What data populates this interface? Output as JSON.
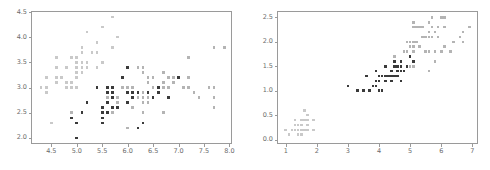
{
  "figure": {
    "background_color": "#ffffff",
    "frame_color": "#9a9a9a",
    "panel_count": 2
  },
  "series_styles": [
    {
      "name": "setosa",
      "color": "#c9c9c9",
      "marker": "square"
    },
    {
      "name": "versicolor",
      "color": "#3a3a3a",
      "marker": "square"
    },
    {
      "name": "virginica",
      "color": "#b4b4b4",
      "marker": "square"
    }
  ],
  "chart_data": [
    {
      "type": "scatter",
      "title": "",
      "xlabel": "",
      "ylabel": "",
      "xlim": [
        4.1,
        8.05
      ],
      "ylim": [
        1.88,
        4.52
      ],
      "xticks": [
        4.5,
        5.0,
        5.5,
        6.0,
        6.5,
        7.0,
        7.5,
        8.0
      ],
      "xtick_labels": [
        "4.5",
        "5.0",
        "5.5",
        "6.0",
        "6.5",
        "7.0",
        "7.5",
        "8.0"
      ],
      "yticks": [
        2.0,
        2.5,
        3.0,
        3.5,
        4.0,
        4.5
      ],
      "ytick_labels": [
        "2.0",
        "2.5",
        "3.0",
        "3.5",
        "4.0",
        "4.5"
      ],
      "grid": false,
      "legend": "none",
      "series": [
        {
          "name": "setosa",
          "color": "#c9c9c9",
          "x": [
            5.1,
            4.9,
            4.7,
            4.6,
            5.0,
            5.4,
            4.6,
            5.0,
            4.4,
            4.9,
            5.4,
            4.8,
            4.8,
            4.3,
            5.8,
            5.7,
            5.4,
            5.1,
            5.7,
            5.1,
            5.4,
            5.1,
            4.6,
            5.1,
            4.8,
            5.0,
            5.0,
            5.2,
            5.2,
            4.7,
            4.8,
            5.4,
            5.2,
            5.5,
            4.9,
            5.0,
            5.5,
            4.9,
            4.4,
            5.1,
            5.0,
            4.5,
            4.4,
            5.0,
            5.1,
            4.8,
            5.1,
            4.6,
            5.3,
            5.0
          ],
          "y": [
            3.5,
            3.0,
            3.2,
            3.1,
            3.6,
            3.9,
            3.4,
            3.4,
            2.9,
            3.1,
            3.7,
            3.4,
            3.0,
            3.0,
            4.0,
            4.4,
            3.9,
            3.5,
            3.8,
            3.8,
            3.4,
            3.7,
            3.6,
            3.3,
            3.4,
            3.0,
            3.4,
            3.5,
            3.4,
            3.2,
            3.1,
            3.4,
            4.1,
            4.2,
            3.1,
            3.2,
            3.5,
            3.6,
            3.0,
            3.4,
            3.5,
            2.3,
            3.2,
            3.5,
            3.8,
            3.0,
            3.8,
            3.2,
            3.7,
            3.3
          ]
        },
        {
          "name": "versicolor",
          "color": "#3a3a3a",
          "x": [
            7.0,
            6.4,
            6.9,
            5.5,
            6.5,
            5.7,
            6.3,
            4.9,
            6.6,
            5.2,
            5.0,
            5.9,
            6.0,
            6.1,
            5.6,
            6.7,
            5.6,
            5.8,
            6.2,
            5.6,
            5.9,
            6.1,
            6.3,
            6.1,
            6.4,
            6.6,
            6.8,
            6.7,
            6.0,
            5.7,
            5.5,
            5.5,
            5.8,
            6.0,
            5.4,
            6.0,
            6.7,
            6.3,
            5.6,
            5.5,
            5.5,
            6.1,
            5.8,
            5.0,
            5.6,
            5.7,
            5.7,
            6.2,
            5.1,
            5.7
          ],
          "y": [
            3.2,
            3.2,
            3.1,
            2.3,
            2.8,
            2.8,
            3.3,
            2.4,
            2.9,
            2.7,
            2.0,
            3.0,
            2.2,
            2.9,
            2.9,
            3.1,
            3.0,
            2.7,
            2.2,
            2.5,
            3.2,
            2.8,
            2.5,
            2.8,
            2.9,
            3.0,
            2.8,
            3.0,
            2.9,
            2.6,
            2.4,
            2.4,
            2.7,
            2.7,
            3.0,
            3.4,
            3.1,
            2.3,
            3.0,
            2.5,
            2.6,
            3.0,
            2.6,
            2.3,
            2.7,
            3.0,
            2.9,
            2.9,
            2.5,
            2.8
          ]
        },
        {
          "name": "virginica",
          "color": "#b4b4b4",
          "x": [
            6.3,
            5.8,
            7.1,
            6.3,
            6.5,
            7.6,
            4.9,
            7.3,
            6.7,
            7.2,
            6.5,
            6.4,
            6.8,
            5.7,
            5.8,
            6.4,
            6.5,
            7.7,
            7.7,
            6.0,
            6.9,
            5.6,
            7.7,
            6.3,
            6.7,
            7.2,
            6.2,
            6.1,
            6.4,
            7.2,
            7.4,
            7.9,
            6.4,
            6.3,
            6.1,
            7.7,
            6.3,
            6.4,
            6.0,
            6.9,
            6.7,
            6.9,
            5.8,
            6.8,
            6.7,
            6.7,
            6.3,
            6.5,
            6.2,
            5.9
          ],
          "y": [
            3.3,
            2.7,
            3.0,
            2.9,
            3.0,
            3.0,
            2.5,
            2.9,
            2.5,
            3.6,
            3.2,
            2.7,
            3.0,
            2.5,
            2.8,
            3.2,
            3.0,
            3.8,
            2.6,
            2.2,
            3.2,
            2.8,
            2.8,
            2.7,
            3.3,
            3.2,
            2.8,
            3.0,
            2.8,
            3.0,
            2.8,
            3.8,
            2.8,
            2.8,
            2.6,
            3.0,
            3.4,
            3.1,
            3.0,
            3.1,
            3.1,
            3.1,
            2.7,
            3.2,
            3.3,
            3.0,
            2.5,
            3.0,
            3.4,
            3.0
          ]
        }
      ]
    },
    {
      "type": "scatter",
      "title": "",
      "xlabel": "",
      "ylabel": "",
      "xlim": [
        0.72,
        7.18
      ],
      "ylim": [
        -0.09,
        2.63
      ],
      "xticks": [
        1,
        2,
        3,
        4,
        5,
        6,
        7
      ],
      "xtick_labels": [
        "1",
        "2",
        "3",
        "4",
        "5",
        "6",
        "7"
      ],
      "yticks": [
        0.0,
        0.5,
        1.0,
        1.5,
        2.0,
        2.5
      ],
      "ytick_labels": [
        "0.0",
        "0.5",
        "1.0",
        "1.5",
        "2.0",
        "2.5"
      ],
      "grid": false,
      "legend": "none",
      "series": [
        {
          "name": "setosa",
          "color": "#c9c9c9",
          "x": [
            1.4,
            1.4,
            1.3,
            1.5,
            1.4,
            1.7,
            1.4,
            1.5,
            1.4,
            1.5,
            1.5,
            1.6,
            1.4,
            1.1,
            1.2,
            1.5,
            1.3,
            1.4,
            1.7,
            1.5,
            1.7,
            1.5,
            1.0,
            1.7,
            1.9,
            1.6,
            1.6,
            1.5,
            1.4,
            1.6,
            1.6,
            1.5,
            1.5,
            1.4,
            1.5,
            1.2,
            1.3,
            1.4,
            1.3,
            1.5,
            1.3,
            1.3,
            1.3,
            1.6,
            1.9,
            1.4,
            1.6,
            1.4,
            1.5,
            1.4
          ],
          "y": [
            0.2,
            0.2,
            0.2,
            0.2,
            0.2,
            0.4,
            0.3,
            0.2,
            0.2,
            0.1,
            0.2,
            0.2,
            0.1,
            0.1,
            0.2,
            0.4,
            0.4,
            0.3,
            0.3,
            0.3,
            0.2,
            0.4,
            0.2,
            0.5,
            0.2,
            0.2,
            0.4,
            0.2,
            0.2,
            0.2,
            0.2,
            0.4,
            0.1,
            0.2,
            0.2,
            0.2,
            0.2,
            0.1,
            0.2,
            0.2,
            0.3,
            0.3,
            0.2,
            0.6,
            0.4,
            0.3,
            0.2,
            0.2,
            0.2,
            0.2
          ]
        },
        {
          "name": "versicolor",
          "color": "#3a3a3a",
          "x": [
            4.7,
            4.5,
            4.9,
            4.0,
            4.6,
            4.5,
            4.7,
            3.3,
            4.6,
            3.9,
            3.5,
            4.2,
            4.0,
            4.7,
            3.6,
            4.4,
            4.5,
            4.1,
            4.5,
            3.9,
            4.8,
            4.0,
            4.9,
            4.7,
            4.3,
            4.4,
            4.8,
            5.0,
            4.5,
            3.5,
            3.8,
            3.7,
            3.9,
            5.1,
            4.5,
            4.5,
            4.7,
            4.4,
            4.1,
            4.0,
            4.4,
            4.6,
            4.0,
            3.3,
            4.2,
            4.2,
            4.2,
            4.3,
            3.0,
            4.1
          ],
          "y": [
            1.4,
            1.5,
            1.5,
            1.3,
            1.5,
            1.3,
            1.6,
            1.0,
            1.3,
            1.4,
            1.0,
            1.5,
            1.0,
            1.4,
            1.3,
            1.4,
            1.5,
            1.0,
            1.5,
            1.1,
            1.8,
            1.3,
            1.5,
            1.2,
            1.3,
            1.4,
            1.4,
            1.7,
            1.5,
            1.0,
            1.1,
            1.0,
            1.2,
            1.6,
            1.5,
            1.6,
            1.5,
            1.3,
            1.3,
            1.3,
            1.2,
            1.4,
            1.2,
            1.0,
            1.3,
            1.2,
            1.3,
            1.3,
            1.1,
            1.3
          ]
        },
        {
          "name": "virginica",
          "color": "#b4b4b4",
          "x": [
            6.0,
            5.1,
            5.9,
            5.6,
            5.8,
            6.6,
            4.5,
            6.3,
            5.8,
            6.1,
            5.1,
            5.3,
            5.5,
            5.0,
            5.1,
            5.3,
            5.5,
            6.7,
            6.9,
            5.0,
            5.7,
            4.9,
            6.7,
            4.9,
            5.7,
            6.0,
            4.8,
            4.9,
            5.6,
            5.8,
            6.1,
            6.4,
            5.6,
            5.1,
            5.6,
            6.1,
            5.6,
            5.5,
            4.8,
            5.4,
            5.6,
            5.1,
            5.1,
            5.9,
            5.7,
            5.2,
            5.0,
            5.2,
            5.4,
            5.1
          ],
          "y": [
            2.5,
            1.9,
            2.1,
            1.8,
            2.2,
            2.1,
            1.7,
            1.8,
            1.8,
            2.5,
            2.0,
            1.9,
            2.1,
            2.0,
            2.4,
            2.3,
            1.8,
            2.2,
            2.3,
            1.5,
            2.3,
            2.0,
            2.0,
            1.8,
            2.1,
            1.8,
            1.8,
            1.8,
            2.1,
            1.6,
            1.9,
            2.0,
            2.2,
            1.5,
            1.4,
            2.3,
            2.4,
            1.8,
            1.8,
            2.1,
            2.4,
            2.3,
            1.9,
            2.3,
            2.5,
            2.3,
            1.9,
            2.0,
            2.3,
            1.8
          ]
        }
      ]
    }
  ]
}
